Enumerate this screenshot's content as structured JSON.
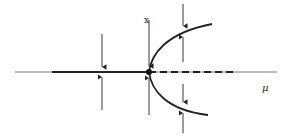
{
  "diagram": {
    "type": "pitchfork-bifurcation",
    "axes": {
      "vertical_label": "x",
      "horizontal_label": "μ"
    },
    "branches": [
      {
        "name": "trivial-stable",
        "style": "solid",
        "range": "μ<0"
      },
      {
        "name": "trivial-unstable",
        "style": "dashed",
        "range": "μ>0"
      },
      {
        "name": "upper-stable",
        "style": "solid",
        "range": "μ>0"
      },
      {
        "name": "lower-stable",
        "style": "solid",
        "range": "μ>0"
      }
    ],
    "bifurcation_point": {
      "marker": "filled-dot"
    },
    "colors": {
      "ink": "#222222",
      "background": "#ffffff"
    }
  }
}
